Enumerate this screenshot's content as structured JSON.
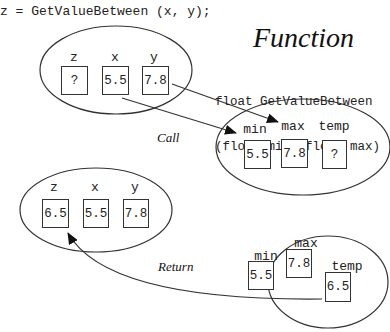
{
  "code": {
    "call_statement": "z = GetValueBetween (x, y);"
  },
  "function_title": "Function",
  "signature": {
    "line1": "float GetValueBetween",
    "line2": "(float min, float max)"
  },
  "caller_before": {
    "vars": [
      {
        "name": "z",
        "value": "?"
      },
      {
        "name": "x",
        "value": "5.5"
      },
      {
        "name": "y",
        "value": "7.8"
      }
    ]
  },
  "callee_call": {
    "vars": [
      {
        "name": "min",
        "value": "5.5"
      },
      {
        "name": "max",
        "value": "7.8"
      },
      {
        "name": "temp",
        "value": "?"
      }
    ]
  },
  "caller_after": {
    "vars": [
      {
        "name": "z",
        "value": "6.5"
      },
      {
        "name": "x",
        "value": "5.5"
      },
      {
        "name": "y",
        "value": "7.8"
      }
    ]
  },
  "callee_return": {
    "vars": [
      {
        "name": "min",
        "value": "5.5"
      },
      {
        "name": "max",
        "value": "7.8"
      },
      {
        "name": "temp",
        "value": "6.5"
      }
    ]
  },
  "labels": {
    "call": "Call",
    "return": "Return"
  },
  "colors": {
    "stroke": "#333333",
    "text": "#222222",
    "background": "#ffffff"
  }
}
